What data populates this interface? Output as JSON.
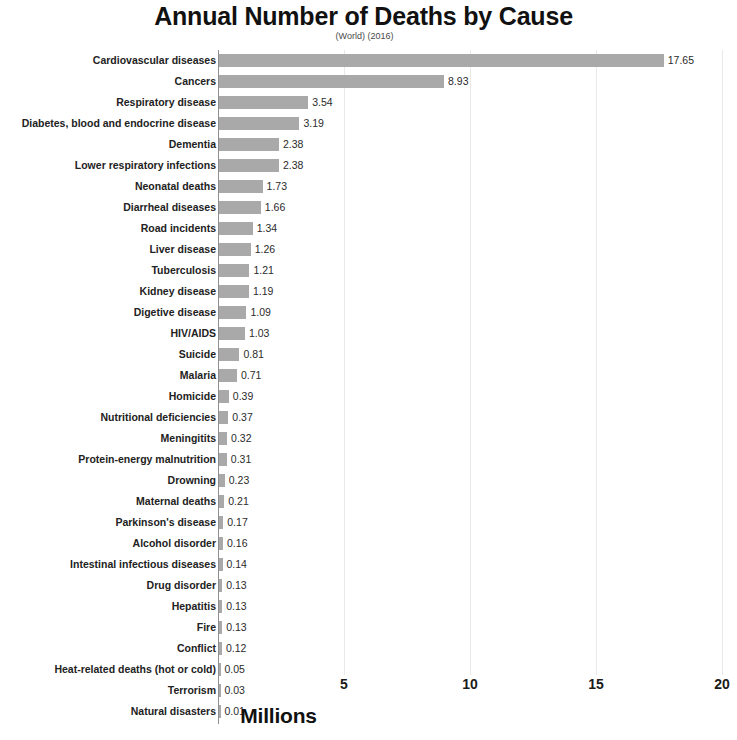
{
  "chart_data": {
    "type": "bar",
    "orientation": "horizontal",
    "title": "Annual Number of Deaths by Cause",
    "subtitle": "(World) (2016)",
    "xlabel": "Millions",
    "ylabel": "",
    "xlim": [
      0,
      20
    ],
    "xticks": [
      "5",
      "10",
      "15",
      "20"
    ],
    "xtick_values": [
      5,
      10,
      15,
      20
    ],
    "grid": true,
    "legend": null,
    "bar_color": "#a9a9a9",
    "categories": [
      "Cardiovascular diseases",
      "Cancers",
      "Respiratory disease",
      "Diabetes, blood and endocrine disease",
      "Dementia",
      "Lower respiratory infections",
      "Neonatal deaths",
      "Diarrheal diseases",
      "Road incidents",
      "Liver disease",
      "Tuberculosis",
      "Kidney disease",
      "Digetive disease",
      "HIV/AIDS",
      "Suicide",
      "Malaria",
      "Homicide",
      "Nutritional deficiencies",
      "Meningitits",
      "Protein-energy malnutrition",
      "Drowning",
      "Maternal deaths",
      "Parkinson's disease",
      "Alcohol disorder",
      "Intestinal infectious diseases",
      "Drug disorder",
      "Hepatitis",
      "Fire",
      "Conflict",
      "Heat-related deaths (hot or cold)",
      "Terrorism",
      "Natural disasters"
    ],
    "values": [
      17.65,
      8.93,
      3.54,
      3.19,
      2.38,
      2.38,
      1.73,
      1.66,
      1.34,
      1.26,
      1.21,
      1.19,
      1.09,
      1.03,
      0.81,
      0.71,
      0.39,
      0.37,
      0.32,
      0.31,
      0.23,
      0.21,
      0.17,
      0.16,
      0.14,
      0.13,
      0.13,
      0.13,
      0.12,
      0.05,
      0.03,
      0.01
    ],
    "value_labels": [
      "17.65",
      "8.93",
      "3.54",
      "3.19",
      "2.38",
      "2.38",
      "1.73",
      "1.66",
      "1.34",
      "1.26",
      "1.21",
      "1.19",
      "1.09",
      "1.03",
      "0.81",
      "0.71",
      "0.39",
      "0.37",
      "0.32",
      "0.31",
      "0.23",
      "0.21",
      "0.17",
      "0.16",
      "0.14",
      "0.13",
      "0.13",
      "0.13",
      "0.12",
      "0.05",
      "0.03",
      "0.01"
    ]
  }
}
